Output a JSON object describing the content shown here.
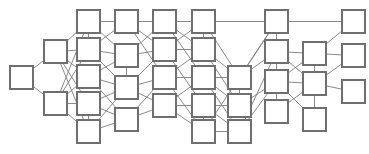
{
  "figure": {
    "kind": "node-link-diagram",
    "title": "",
    "width": 369,
    "height": 154,
    "background_color": "#ffffff",
    "node_fill_color": "#ffffff",
    "node_stroke_color": "#6f6f6f",
    "edge_color": "#7d7d7d",
    "node_shape": "square",
    "node_size": 23,
    "node_count": 33,
    "edge_count": 70,
    "label_text": "",
    "layout": "layered-left-to-right"
  },
  "graph": {
    "nodes": [
      {
        "id": "n0",
        "label": "",
        "x": 10,
        "y": 66,
        "column": 1
      },
      {
        "id": "n1",
        "label": "",
        "x": 44,
        "y": 40,
        "column": 2
      },
      {
        "id": "n2",
        "label": "",
        "x": 44,
        "y": 92,
        "column": 2
      },
      {
        "id": "n3",
        "label": "",
        "x": 77,
        "y": 10,
        "column": 3
      },
      {
        "id": "n4",
        "label": "",
        "x": 77,
        "y": 38,
        "column": 3
      },
      {
        "id": "n5",
        "label": "",
        "x": 77,
        "y": 65,
        "column": 3
      },
      {
        "id": "n6",
        "label": "",
        "x": 77,
        "y": 92,
        "column": 3
      },
      {
        "id": "n7",
        "label": "",
        "x": 77,
        "y": 120,
        "column": 3
      },
      {
        "id": "n8",
        "label": "",
        "x": 115,
        "y": 10,
        "column": 4
      },
      {
        "id": "n9",
        "label": "",
        "x": 115,
        "y": 44,
        "column": 4
      },
      {
        "id": "n10",
        "label": "",
        "x": 115,
        "y": 76,
        "column": 4
      },
      {
        "id": "n11",
        "label": "",
        "x": 115,
        "y": 108,
        "column": 4
      },
      {
        "id": "n12",
        "label": "",
        "x": 153,
        "y": 10,
        "column": 5
      },
      {
        "id": "n13",
        "label": "",
        "x": 153,
        "y": 38,
        "column": 5
      },
      {
        "id": "n14",
        "label": "",
        "x": 153,
        "y": 66,
        "column": 5
      },
      {
        "id": "n15",
        "label": "",
        "x": 153,
        "y": 94,
        "column": 5
      },
      {
        "id": "n16",
        "label": "",
        "x": 192,
        "y": 10,
        "column": 6
      },
      {
        "id": "n17",
        "label": "",
        "x": 192,
        "y": 38,
        "column": 6
      },
      {
        "id": "n18",
        "label": "",
        "x": 192,
        "y": 66,
        "column": 6
      },
      {
        "id": "n19",
        "label": "",
        "x": 192,
        "y": 94,
        "column": 6
      },
      {
        "id": "n20",
        "label": "",
        "x": 192,
        "y": 120,
        "column": 6
      },
      {
        "id": "n21",
        "label": "",
        "x": 228,
        "y": 66,
        "column": 7
      },
      {
        "id": "n22",
        "label": "",
        "x": 228,
        "y": 94,
        "column": 7
      },
      {
        "id": "n23",
        "label": "",
        "x": 228,
        "y": 120,
        "column": 7
      },
      {
        "id": "n24",
        "label": "",
        "x": 265,
        "y": 10,
        "column": 8
      },
      {
        "id": "n25",
        "label": "",
        "x": 265,
        "y": 40,
        "column": 8
      },
      {
        "id": "n26",
        "label": "",
        "x": 265,
        "y": 70,
        "column": 8
      },
      {
        "id": "n27",
        "label": "",
        "x": 265,
        "y": 100,
        "column": 8
      },
      {
        "id": "n28",
        "label": "",
        "x": 303,
        "y": 42,
        "column": 9
      },
      {
        "id": "n29",
        "label": "",
        "x": 303,
        "y": 72,
        "column": 9
      },
      {
        "id": "n30",
        "label": "",
        "x": 303,
        "y": 108,
        "column": 9
      },
      {
        "id": "n31",
        "label": "",
        "x": 342,
        "y": 10,
        "column": 10
      },
      {
        "id": "n32",
        "label": "",
        "x": 342,
        "y": 44,
        "column": 10
      },
      {
        "id": "n33",
        "label": "",
        "x": 342,
        "y": 80,
        "column": 10
      }
    ],
    "edges": [
      [
        "n0",
        "n1"
      ],
      [
        "n0",
        "n2"
      ],
      [
        "n1",
        "n3"
      ],
      [
        "n1",
        "n4"
      ],
      [
        "n1",
        "n5"
      ],
      [
        "n1",
        "n6"
      ],
      [
        "n1",
        "n7"
      ],
      [
        "n2",
        "n4"
      ],
      [
        "n2",
        "n5"
      ],
      [
        "n2",
        "n6"
      ],
      [
        "n2",
        "n7"
      ],
      [
        "n2",
        "n3"
      ],
      [
        "n3",
        "n4"
      ],
      [
        "n3",
        "n8"
      ],
      [
        "n3",
        "n9"
      ],
      [
        "n4",
        "n8"
      ],
      [
        "n4",
        "n9"
      ],
      [
        "n4",
        "n10"
      ],
      [
        "n5",
        "n9"
      ],
      [
        "n5",
        "n10"
      ],
      [
        "n5",
        "n11"
      ],
      [
        "n6",
        "n7"
      ],
      [
        "n6",
        "n10"
      ],
      [
        "n6",
        "n11"
      ],
      [
        "n7",
        "n10"
      ],
      [
        "n7",
        "n11"
      ],
      [
        "n8",
        "n12"
      ],
      [
        "n8",
        "n13"
      ],
      [
        "n8",
        "n14"
      ],
      [
        "n9",
        "n10"
      ],
      [
        "n9",
        "n12"
      ],
      [
        "n9",
        "n13"
      ],
      [
        "n10",
        "n13"
      ],
      [
        "n10",
        "n14"
      ],
      [
        "n10",
        "n15"
      ],
      [
        "n11",
        "n14"
      ],
      [
        "n11",
        "n15"
      ],
      [
        "n12",
        "n16"
      ],
      [
        "n12",
        "n17"
      ],
      [
        "n12",
        "n18"
      ],
      [
        "n13",
        "n16"
      ],
      [
        "n13",
        "n17"
      ],
      [
        "n13",
        "n19"
      ],
      [
        "n14",
        "n17"
      ],
      [
        "n14",
        "n18"
      ],
      [
        "n14",
        "n20"
      ],
      [
        "n15",
        "n18"
      ],
      [
        "n15",
        "n19"
      ],
      [
        "n15",
        "n20"
      ],
      [
        "n16",
        "n17"
      ],
      [
        "n16",
        "n24"
      ],
      [
        "n16",
        "n21"
      ],
      [
        "n17",
        "n21"
      ],
      [
        "n17",
        "n22"
      ],
      [
        "n18",
        "n21"
      ],
      [
        "n18",
        "n22"
      ],
      [
        "n18",
        "n23"
      ],
      [
        "n19",
        "n20"
      ],
      [
        "n19",
        "n22"
      ],
      [
        "n19",
        "n23"
      ],
      [
        "n20",
        "n23"
      ],
      [
        "n20",
        "n24"
      ],
      [
        "n21",
        "n22"
      ],
      [
        "n21",
        "n24"
      ],
      [
        "n21",
        "n25"
      ],
      [
        "n22",
        "n26"
      ],
      [
        "n23",
        "n25"
      ],
      [
        "n23",
        "n26"
      ],
      [
        "n24",
        "n25"
      ],
      [
        "n24",
        "n31"
      ],
      [
        "n25",
        "n26"
      ],
      [
        "n25",
        "n28"
      ],
      [
        "n25",
        "n29"
      ],
      [
        "n26",
        "n27"
      ],
      [
        "n26",
        "n28"
      ],
      [
        "n26",
        "n29"
      ],
      [
        "n26",
        "n30"
      ],
      [
        "n27",
        "n29"
      ],
      [
        "n28",
        "n29"
      ],
      [
        "n28",
        "n31"
      ],
      [
        "n28",
        "n32"
      ],
      [
        "n29",
        "n30"
      ],
      [
        "n29",
        "n32"
      ],
      [
        "n29",
        "n33"
      ]
    ]
  }
}
